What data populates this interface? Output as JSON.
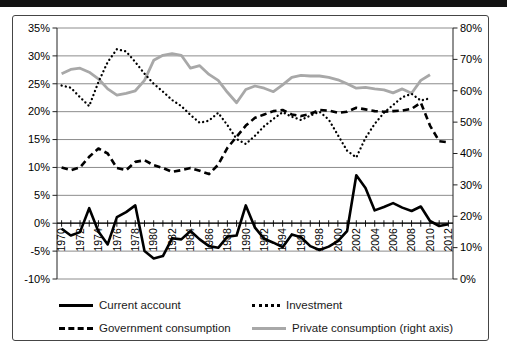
{
  "chart_data": {
    "type": "line",
    "title": "",
    "xlabel": "",
    "ylabel_left": "",
    "ylabel_right": "",
    "grid": "horizontal",
    "legend_position": "bottom",
    "x": [
      1970,
      1971,
      1972,
      1973,
      1974,
      1975,
      1976,
      1977,
      1978,
      1979,
      1980,
      1981,
      1982,
      1983,
      1984,
      1985,
      1986,
      1987,
      1988,
      1989,
      1990,
      1991,
      1992,
      1993,
      1994,
      1995,
      1996,
      1997,
      1998,
      1999,
      2000,
      2001,
      2002,
      2003,
      2004,
      2005,
      2006,
      2007,
      2008,
      2009,
      2010,
      2011,
      2012
    ],
    "x_tick_labels": [
      "1970",
      "1972",
      "1974",
      "1976",
      "1978",
      "1980",
      "1982",
      "1984",
      "1986",
      "1988",
      "1990",
      "1992",
      "1994",
      "1996",
      "1998",
      "2000",
      "2002",
      "2004",
      "2006",
      "2008",
      "2010",
      "2012"
    ],
    "axes": {
      "left": {
        "min": -10,
        "max": 35,
        "step": 5,
        "tick_labels": [
          "35%",
          "30%",
          "25%",
          "20%",
          "15%",
          "10%",
          "5%",
          "0%",
          "-5%",
          "-10%"
        ]
      },
      "right": {
        "min": 0,
        "max": 80,
        "step": 10,
        "tick_labels": [
          "80%",
          "70%",
          "60%",
          "50%",
          "40%",
          "30%",
          "20%",
          "10%",
          "0%"
        ]
      }
    },
    "colors": {
      "black_series": "#000000",
      "gray_series": "#a8a8a8",
      "gridline": "#8c8c8c"
    },
    "series": [
      {
        "name": "Current account",
        "axis": "left",
        "style": "solid-black",
        "values": [
          -1.0,
          -2.2,
          -1.6,
          2.7,
          -1.5,
          -3.8,
          1.1,
          2.0,
          3.2,
          -5.0,
          -6.3,
          -5.9,
          -2.7,
          -2.9,
          -1.4,
          -2.9,
          -4.1,
          -4.4,
          -2.4,
          -2.2,
          3.2,
          -0.8,
          -2.8,
          -3.5,
          -4.3,
          -2.0,
          -2.5,
          -4.1,
          -4.8,
          -4.2,
          -3.2,
          -1.4,
          8.6,
          6.3,
          2.3,
          2.9,
          3.6,
          2.8,
          2.2,
          3.0,
          0.4,
          -0.5,
          -0.2
        ]
      },
      {
        "name": "Investment",
        "axis": "left",
        "style": "dotted-black",
        "values": [
          24.7,
          24.3,
          22.6,
          21.0,
          25.3,
          28.9,
          31.2,
          30.8,
          28.9,
          26.8,
          25.0,
          23.6,
          22.1,
          21.0,
          19.4,
          18.0,
          18.4,
          19.8,
          17.6,
          15.1,
          14.2,
          15.7,
          17.4,
          18.7,
          19.9,
          19.1,
          18.5,
          19.3,
          20.0,
          18.6,
          15.8,
          13.0,
          11.8,
          15.3,
          17.8,
          19.8,
          21.2,
          22.6,
          23.2,
          22.0,
          22.4,
          null,
          null
        ]
      },
      {
        "name": "Government consumption",
        "axis": "left",
        "style": "dashed-black",
        "values": [
          10.0,
          9.5,
          10.0,
          11.9,
          13.4,
          12.5,
          9.9,
          9.5,
          11.0,
          11.3,
          10.4,
          9.9,
          9.2,
          9.5,
          9.9,
          9.4,
          8.8,
          10.5,
          13.5,
          15.5,
          17.5,
          18.9,
          19.5,
          20.1,
          20.3,
          19.5,
          19.2,
          19.6,
          20.3,
          20.2,
          19.8,
          20.0,
          20.7,
          20.4,
          20.1,
          20.0,
          20.1,
          20.2,
          20.5,
          21.6,
          17.5,
          14.7,
          14.5
        ]
      },
      {
        "name": "Private consumption (right axis)",
        "axis": "right",
        "style": "solid-gray",
        "values": [
          65.4,
          66.8,
          67.2,
          65.9,
          63.8,
          60.6,
          58.6,
          59.2,
          60.0,
          63.3,
          69.7,
          71.3,
          71.8,
          71.3,
          67.2,
          68.0,
          65.2,
          63.3,
          59.5,
          56.2,
          60.4,
          61.5,
          60.8,
          59.7,
          61.9,
          64.3,
          64.9,
          64.7,
          64.7,
          64.3,
          63.5,
          62.2,
          60.8,
          61.1,
          60.6,
          60.3,
          59.3,
          60.6,
          59.2,
          63.3,
          65.1,
          null,
          null
        ]
      }
    ]
  }
}
